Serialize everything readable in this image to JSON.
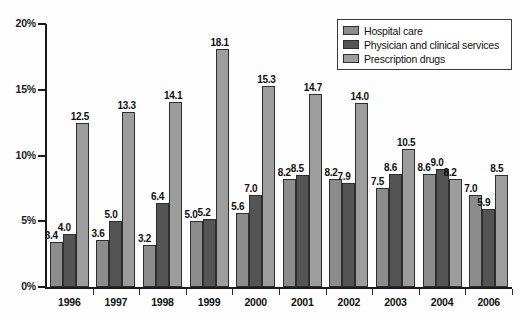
{
  "chart_data": {
    "type": "bar",
    "title": "",
    "subtitle": "",
    "xlabel": "",
    "ylabel": "",
    "ylim": [
      0,
      20
    ],
    "ytick_labels": [
      "0%",
      "5%",
      "10%",
      "15%",
      "20%"
    ],
    "ytick_values": [
      0,
      5,
      10,
      15,
      20
    ],
    "grid": false,
    "legend_position": "top-right",
    "categories": [
      "1996",
      "1997",
      "1998",
      "1999",
      "2000",
      "2001",
      "2002",
      "2003",
      "2004",
      "2006"
    ],
    "series": [
      {
        "name": "Hospital care",
        "color": "#8c8c8c",
        "values": [
          3.4,
          3.6,
          3.2,
          5.0,
          5.6,
          8.2,
          8.2,
          7.5,
          8.6,
          7.0
        ],
        "labels": [
          "3.4",
          "3.6",
          "3.2",
          "5.0",
          "5.6",
          "8.2",
          "8.2",
          "7.5",
          "8.6",
          "7.0"
        ]
      },
      {
        "name": "Physician and clinical services",
        "color": "#545454",
        "values": [
          4.0,
          5.0,
          6.4,
          5.2,
          7.0,
          8.5,
          7.9,
          8.6,
          9.0,
          5.9
        ],
        "labels": [
          "4.0",
          "5.0",
          "6.4",
          "5.2",
          "7.0",
          "8.5",
          "7.9",
          "8.6",
          "9.0",
          "5.9"
        ]
      },
      {
        "name": "Prescription drugs",
        "color": "#9d9d9d",
        "values": [
          12.5,
          13.3,
          14.1,
          18.1,
          15.3,
          14.7,
          14.0,
          10.5,
          8.2,
          8.5
        ],
        "labels": [
          "12.5",
          "13.3",
          "14.1",
          "18.1",
          "15.3",
          "14.7",
          "14.0",
          "10.5",
          "8.2",
          "8.5"
        ]
      }
    ]
  },
  "legend": {
    "items": [
      {
        "label": "Hospital care"
      },
      {
        "label": "Physician and clinical services"
      },
      {
        "label": "Prescription drugs"
      }
    ]
  }
}
